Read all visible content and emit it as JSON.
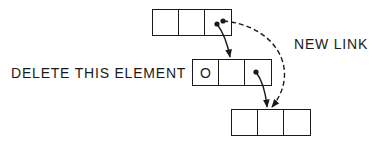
{
  "diagram": {
    "labels": {
      "new_link": "NEW LINK",
      "delete_element": "DELETE THIS ELEMENT"
    },
    "nodes": [
      {
        "id": "top",
        "cells": [
          "",
          "",
          "•"
        ]
      },
      {
        "id": "middle",
        "cells": [
          "O",
          "",
          "•"
        ]
      },
      {
        "id": "bottom",
        "cells": [
          "",
          "",
          ""
        ]
      }
    ],
    "arrows": [
      {
        "from": "top.cell3",
        "to": "middle",
        "style": "solid"
      },
      {
        "from": "middle.cell3",
        "to": "bottom",
        "style": "solid"
      },
      {
        "from": "top.cell3",
        "to": "bottom",
        "style": "dashed",
        "label": "NEW LINK"
      }
    ],
    "colors": {
      "ink": "#1a1a1a",
      "background": "#ffffff"
    }
  }
}
